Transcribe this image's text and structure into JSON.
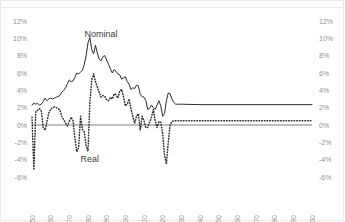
{
  "chart_data": {
    "type": "line",
    "title": "",
    "xlabel": "",
    "ylabel": "",
    "ylim": [
      -6,
      12
    ],
    "xlim": [
      1950,
      2100
    ],
    "grid": false,
    "legend_position": "inline-annotation",
    "y_ticks": [
      "12%",
      "10%",
      "8%",
      "6%",
      "4%",
      "2%",
      "0%",
      "-2%",
      "-4%",
      "-6%"
    ],
    "y_tick_values": [
      12,
      10,
      8,
      6,
      4,
      2,
      0,
      -2,
      -4,
      -6
    ],
    "y_axis_right_ticks": [
      "12%",
      "10%",
      "8%",
      "6%",
      "4%",
      "2%",
      "0%",
      "-2%",
      "-4%",
      "-6%"
    ],
    "x_ticks": [
      "1950",
      "1960",
      "1970",
      "1980",
      "1990",
      "2000",
      "2010",
      "2020",
      "2030",
      "2040",
      "2050",
      "2060",
      "2070",
      "2080",
      "2090",
      "2100"
    ],
    "x_tick_values": [
      1950,
      1960,
      1970,
      1980,
      1990,
      2000,
      2010,
      2020,
      2030,
      2040,
      2050,
      2060,
      2070,
      2080,
      2090,
      2100
    ],
    "annotations": [
      {
        "text": "Nominal",
        "x": 1987,
        "y": 10.2
      },
      {
        "text": "Real",
        "x": 1981,
        "y": -4.3
      }
    ],
    "series": [
      {
        "name": "Nominal",
        "style": "solid",
        "color": "#2b2b2b",
        "x": [
          1950,
          1951,
          1952,
          1953,
          1954,
          1955,
          1956,
          1957,
          1958,
          1959,
          1960,
          1961,
          1962,
          1963,
          1964,
          1965,
          1966,
          1967,
          1968,
          1969,
          1970,
          1971,
          1972,
          1973,
          1974,
          1975,
          1976,
          1977,
          1978,
          1979,
          1980,
          1981,
          1982,
          1983,
          1984,
          1985,
          1986,
          1987,
          1988,
          1989,
          1990,
          1991,
          1992,
          1993,
          1994,
          1995,
          1996,
          1997,
          1998,
          1999,
          2000,
          2001,
          2002,
          2003,
          2004,
          2005,
          2006,
          2007,
          2008,
          2009,
          2010,
          2011,
          2012,
          2013,
          2014,
          2015,
          2016,
          2017,
          2018,
          2019,
          2020,
          2021,
          2022,
          2023,
          2024,
          2025,
          2026,
          2027,
          2028,
          2029,
          2030,
          2040,
          2050,
          2060,
          2070,
          2080,
          2090,
          2100
        ],
        "values": [
          2.3,
          2.5,
          2.4,
          2.5,
          2.3,
          2.4,
          2.7,
          3.1,
          2.8,
          3.0,
          3.1,
          3.0,
          3.1,
          3.2,
          3.3,
          3.4,
          3.8,
          4.0,
          4.3,
          4.8,
          5.2,
          5.0,
          5.1,
          5.5,
          6.0,
          5.9,
          6.1,
          6.3,
          7.0,
          8.0,
          9.5,
          10.1,
          8.7,
          8.2,
          9.2,
          8.3,
          7.6,
          7.4,
          7.9,
          8.0,
          7.5,
          7.0,
          6.5,
          6.0,
          6.4,
          6.2,
          5.9,
          5.8,
          5.3,
          5.4,
          5.6,
          5.0,
          4.7,
          4.1,
          4.3,
          4.2,
          4.6,
          4.5,
          3.5,
          3.3,
          3.2,
          2.8,
          1.8,
          1.9,
          2.3,
          2.0,
          1.8,
          2.3,
          2.8,
          2.2,
          1.0,
          1.3,
          2.8,
          3.7,
          3.6,
          3.0,
          2.6,
          2.4,
          2.4,
          2.4,
          2.4,
          2.35,
          2.35,
          2.35,
          2.35,
          2.35,
          2.35,
          2.35
        ]
      },
      {
        "name": "Real",
        "style": "dotted",
        "color": "#2b2b2b",
        "x": [
          1950,
          1951,
          1952,
          1953,
          1954,
          1955,
          1956,
          1957,
          1958,
          1959,
          1960,
          1961,
          1962,
          1963,
          1964,
          1965,
          1966,
          1967,
          1968,
          1969,
          1970,
          1971,
          1972,
          1973,
          1974,
          1975,
          1976,
          1977,
          1978,
          1979,
          1980,
          1981,
          1982,
          1983,
          1984,
          1985,
          1986,
          1987,
          1988,
          1989,
          1990,
          1991,
          1992,
          1993,
          1994,
          1995,
          1996,
          1997,
          1998,
          1999,
          2000,
          2001,
          2002,
          2003,
          2004,
          2005,
          2006,
          2007,
          2008,
          2009,
          2010,
          2011,
          2012,
          2013,
          2014,
          2015,
          2016,
          2017,
          2018,
          2019,
          2020,
          2021,
          2022,
          2023,
          2024,
          2025,
          2026,
          2027,
          2028,
          2029,
          2030,
          2040,
          2050,
          2060,
          2070,
          2080,
          2090,
          2100
        ],
        "values": [
          0.9,
          -5.2,
          1.5,
          1.7,
          1.9,
          1.6,
          -0.3,
          -0.6,
          0.4,
          1.4,
          1.8,
          2.0,
          2.1,
          2.0,
          1.9,
          1.7,
          1.0,
          0.6,
          0.2,
          -0.1,
          0.4,
          0.9,
          0.5,
          -1.5,
          -3.1,
          -2.6,
          1.0,
          -0.5,
          -0.8,
          -2.4,
          -3.0,
          2.6,
          5.2,
          5.9,
          5.0,
          4.4,
          3.8,
          3.2,
          3.4,
          3.3,
          2.9,
          2.8,
          3.2,
          3.0,
          3.6,
          3.5,
          3.1,
          3.9,
          4.1,
          3.3,
          2.2,
          2.4,
          3.0,
          1.9,
          1.0,
          0.2,
          1.0,
          1.3,
          -0.6,
          1.0,
          0.5,
          -0.3,
          -0.3,
          0.3,
          0.9,
          1.8,
          0.5,
          -0.3,
          0.4,
          0.3,
          -1.0,
          -3.5,
          -4.5,
          -2.0,
          0.0,
          0.4,
          0.5,
          0.5,
          0.5,
          0.5,
          0.5,
          0.5,
          0.5,
          0.5,
          0.5,
          0.5,
          0.5,
          0.5
        ]
      }
    ]
  }
}
